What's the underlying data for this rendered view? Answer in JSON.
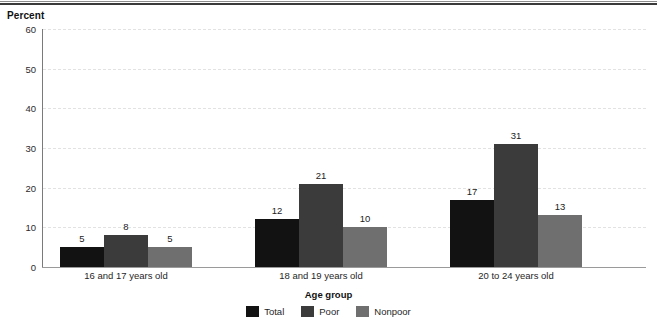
{
  "rules": {
    "present": true
  },
  "axis": {
    "y_title": "Percent",
    "x_title": "Age group",
    "y_ticks": [
      "0",
      "10",
      "20",
      "30",
      "40",
      "50",
      "60"
    ]
  },
  "legend": {
    "items": [
      {
        "label": "Total",
        "color": "#121212"
      },
      {
        "label": "Poor",
        "color": "#3b3b3b"
      },
      {
        "label": "Nonpoor",
        "color": "#6f6f6f"
      }
    ]
  },
  "chart_data": {
    "type": "bar",
    "title": "",
    "xlabel": "Age group",
    "ylabel": "Percent",
    "ylim": [
      0,
      60
    ],
    "ytick_step": 10,
    "grid": true,
    "legend_position": "bottom-center",
    "categories": [
      "16 and 17 years old",
      "18 and 19 years old",
      "20 to 24 years old"
    ],
    "series": [
      {
        "name": "Total",
        "color": "#121212",
        "values": [
          5,
          12,
          17
        ]
      },
      {
        "name": "Poor",
        "color": "#3b3b3b",
        "values": [
          8,
          21,
          31
        ]
      },
      {
        "name": "Nonpoor",
        "color": "#6f6f6f",
        "values": [
          5,
          10,
          13
        ]
      }
    ],
    "data_labels": [
      [
        "5",
        "8",
        "5"
      ],
      [
        "12",
        "21",
        "10"
      ],
      [
        "17",
        "31",
        "13"
      ]
    ]
  }
}
